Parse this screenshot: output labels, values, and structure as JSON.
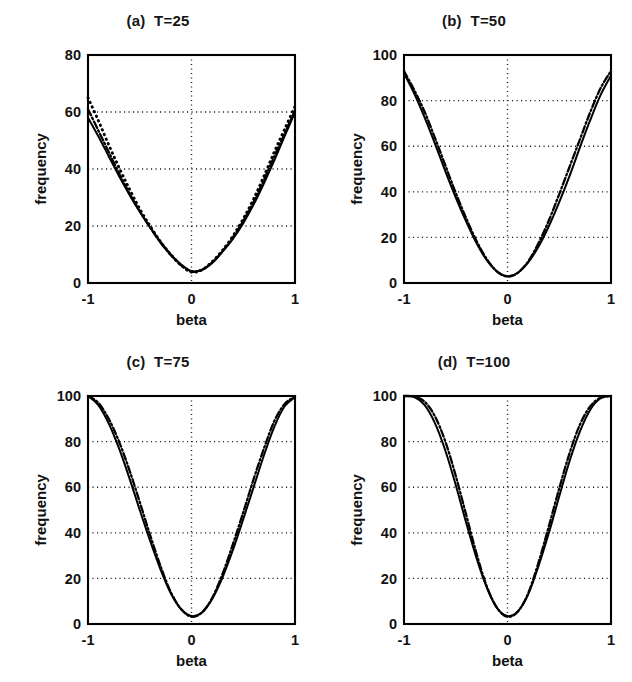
{
  "figure": {
    "background": "#ffffff",
    "ink": "#000000",
    "panel_count": 4,
    "layout": "2x2"
  },
  "chart_data": [
    {
      "type": "line",
      "panel": "a",
      "title": "(a)  T=25",
      "xlabel": "beta",
      "ylabel": "frequency",
      "xlim": [
        -1,
        1
      ],
      "ylim": [
        0,
        80
      ],
      "xticks": [
        -1,
        0,
        1
      ],
      "xticklabels": [
        "-1",
        "0",
        "1"
      ],
      "yticks": [
        0,
        20,
        40,
        60,
        80
      ],
      "yticklabels": [
        "0",
        "20",
        "40",
        "60",
        "80"
      ],
      "grid": true,
      "grid_style": "dotted",
      "legend": "none",
      "x": [
        -1,
        -0.9,
        -0.8,
        -0.7,
        -0.6,
        -0.5,
        -0.4,
        -0.3,
        -0.2,
        -0.1,
        0,
        0.1,
        0.2,
        0.3,
        0.4,
        0.5,
        0.6,
        0.7,
        0.8,
        0.9,
        1
      ],
      "series": [
        {
          "name": "solid",
          "style": "solid",
          "values": [
            58,
            51.5,
            44.5,
            37.5,
            31,
            25,
            19.5,
            14.5,
            10,
            6.5,
            4.2,
            4.6,
            7,
            11,
            15.5,
            21,
            27.5,
            35,
            43,
            51.5,
            60
          ]
        },
        {
          "name": "dotted",
          "style": "dotted",
          "values": [
            65,
            57,
            48.5,
            40.5,
            33,
            26,
            20,
            14.5,
            10,
            6.2,
            3.8,
            4.6,
            7.5,
            11.5,
            16.5,
            22.5,
            29.5,
            37.5,
            46,
            54,
            62
          ]
        },
        {
          "name": "dash-dot",
          "style": "dashdot",
          "values": [
            61,
            53.5,
            46,
            38.5,
            31.5,
            25.2,
            19.5,
            14.2,
            9.8,
            6.2,
            4.0,
            4.6,
            7.2,
            11.2,
            16,
            21.8,
            28.5,
            36.2,
            44.5,
            52.5,
            60.5
          ]
        }
      ]
    },
    {
      "type": "line",
      "panel": "b",
      "title": "(b)  T=50",
      "xlabel": "beta",
      "ylabel": "frequency",
      "xlim": [
        -1,
        1
      ],
      "ylim": [
        0,
        100
      ],
      "xticks": [
        -1,
        0,
        1
      ],
      "xticklabels": [
        "-1",
        "0",
        "1"
      ],
      "yticks": [
        0,
        20,
        40,
        60,
        80,
        100
      ],
      "yticklabels": [
        "0",
        "20",
        "40",
        "60",
        "80",
        "100"
      ],
      "grid": true,
      "grid_style": "dotted",
      "legend": "none",
      "x": [
        -1,
        -0.9,
        -0.8,
        -0.7,
        -0.6,
        -0.5,
        -0.4,
        -0.3,
        -0.2,
        -0.1,
        0,
        0.1,
        0.2,
        0.3,
        0.4,
        0.5,
        0.6,
        0.7,
        0.8,
        0.9,
        1
      ],
      "series": [
        {
          "name": "solid",
          "style": "solid",
          "values": [
            92,
            83,
            72.5,
            61,
            49,
            37.5,
            27,
            17.5,
            10,
            5,
            3,
            4.5,
            9,
            16,
            25,
            35.5,
            47,
            59.5,
            71.5,
            82.5,
            91
          ]
        },
        {
          "name": "dash-dot",
          "style": "dashdot",
          "values": [
            93,
            84.5,
            75,
            63.5,
            51.5,
            39.5,
            28.5,
            18.5,
            10.5,
            5,
            2.8,
            4.5,
            9.5,
            17.5,
            27.5,
            39,
            51,
            63,
            75,
            85.5,
            93
          ]
        }
      ]
    },
    {
      "type": "line",
      "panel": "c",
      "title": "(c)  T=75",
      "xlabel": "beta",
      "ylabel": "frequency",
      "xlim": [
        -1,
        1
      ],
      "ylim": [
        0,
        100
      ],
      "xticks": [
        -1,
        0,
        1
      ],
      "xticklabels": [
        "-1",
        "0",
        "1"
      ],
      "yticks": [
        0,
        20,
        40,
        60,
        80,
        100
      ],
      "yticklabels": [
        "0",
        "20",
        "40",
        "60",
        "80",
        "100"
      ],
      "grid": true,
      "grid_style": "dotted",
      "legend": "none",
      "x": [
        -1,
        -0.9,
        -0.8,
        -0.7,
        -0.6,
        -0.5,
        -0.4,
        -0.3,
        -0.2,
        -0.1,
        0,
        0.1,
        0.2,
        0.3,
        0.4,
        0.5,
        0.6,
        0.7,
        0.8,
        0.9,
        1
      ],
      "series": [
        {
          "name": "solid",
          "style": "solid",
          "values": [
            100,
            96,
            88,
            77,
            64,
            50,
            36.5,
            24,
            13.5,
            6.5,
            3.5,
            5,
            11,
            20.5,
            32.5,
            46,
            60,
            74,
            86.5,
            95.5,
            99.5
          ]
        },
        {
          "name": "dash-dot",
          "style": "dashdot",
          "values": [
            100,
            97,
            90,
            80,
            67.5,
            53.5,
            39,
            25.5,
            14,
            6.5,
            3.2,
            5,
            11.5,
            22,
            35,
            49,
            63.5,
            77,
            89,
            96.5,
            99.8
          ]
        }
      ]
    },
    {
      "type": "line",
      "panel": "d",
      "title": "(d)  T=100",
      "xlabel": "beta",
      "ylabel": "frequency",
      "xlim": [
        -1,
        1
      ],
      "ylim": [
        0,
        100
      ],
      "xticks": [
        -1,
        0,
        1
      ],
      "xticklabels": [
        "-1",
        "0",
        "1"
      ],
      "yticks": [
        0,
        20,
        40,
        60,
        80,
        100
      ],
      "yticklabels": [
        "0",
        "20",
        "40",
        "60",
        "80",
        "100"
      ],
      "grid": true,
      "grid_style": "dotted",
      "legend": "none",
      "x": [
        -1,
        -0.9,
        -0.8,
        -0.7,
        -0.6,
        -0.5,
        -0.4,
        -0.3,
        -0.2,
        -0.1,
        0,
        0.1,
        0.2,
        0.3,
        0.4,
        0.5,
        0.6,
        0.7,
        0.8,
        0.9,
        1
      ],
      "series": [
        {
          "name": "solid",
          "style": "solid",
          "values": [
            100,
            99.5,
            96,
            88,
            76,
            61,
            44.5,
            29,
            16,
            7,
            3.5,
            5.5,
            13,
            25.5,
            40,
            56,
            71.5,
            84.5,
            94,
            99,
            100
          ]
        },
        {
          "name": "dash-dot",
          "style": "dashdot",
          "values": [
            100,
            99.7,
            97.5,
            91,
            80,
            65,
            48,
            31,
            16.5,
            7,
            3.2,
            5.5,
            13.5,
            27,
            43,
            59.5,
            75,
            87.5,
            95.5,
            99.3,
            100
          ]
        }
      ]
    }
  ]
}
